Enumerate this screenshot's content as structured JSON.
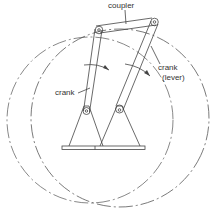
{
  "diagram": {
    "labels": {
      "coupler": "coupler",
      "crank": "crank",
      "lever_line1": "crank",
      "lever_line2": "(lever)"
    },
    "colors": {
      "line": "#444444",
      "text": "#333333",
      "background": "#ffffff"
    }
  }
}
